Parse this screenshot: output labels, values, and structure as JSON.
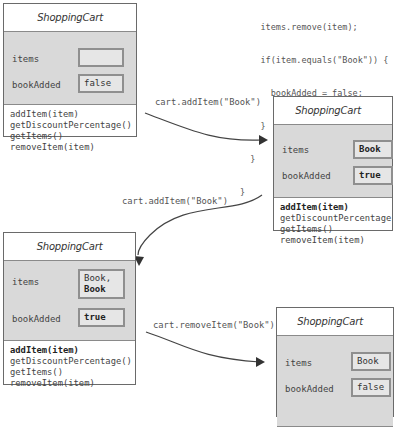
{
  "code_snippet": {
    "lines": [
      "    items.remove(item);",
      "    if(item.equals(\"Book\")) {",
      "      bookAdded = false;",
      "    }",
      "  }",
      "}"
    ]
  },
  "boxes": [
    {
      "title": "ShoppingCart",
      "attributes": [
        {
          "name": "items",
          "value": ""
        },
        {
          "name": "bookAdded",
          "value": "false"
        }
      ],
      "methods": [
        "addItem(item)",
        "getDiscountPercentage()",
        "getItems()",
        "removeItem(item)"
      ]
    },
    {
      "title": "ShoppingCart",
      "attributes": [
        {
          "name": "items",
          "value": "Book"
        },
        {
          "name": "bookAdded",
          "value": "true"
        }
      ],
      "methods": [
        "addItem(item)",
        "getDiscountPercentage(",
        "getItems()",
        "removeItem(item)"
      ]
    },
    {
      "title": "ShoppingCart",
      "attributes": [
        {
          "name": "items",
          "value_line1": "Book,",
          "value_line2": "Book"
        },
        {
          "name": "bookAdded",
          "value": "true"
        }
      ],
      "methods": [
        "addItem(item)",
        "getDiscountPercentage()",
        "getItems()",
        "removeItem(item)"
      ]
    },
    {
      "title": "ShoppingCart",
      "attributes": [
        {
          "name": "items",
          "value": "Book"
        },
        {
          "name": "bookAdded",
          "value": "false"
        }
      ]
    }
  ],
  "transitions": [
    {
      "label": "cart.addItem(\"Book\")"
    },
    {
      "label": "cart.addItem(\"Book\")"
    },
    {
      "label": "cart.removeItem(\"Book\");"
    }
  ]
}
